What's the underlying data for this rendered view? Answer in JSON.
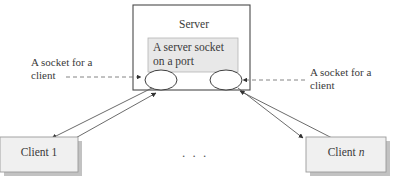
{
  "diagram": {
    "title_server": "Server",
    "server_socket_label": "A server socket\non a port",
    "left_note": "A socket for a\nclient",
    "right_note": "A socket for a\nclient",
    "client_first": "Client 1",
    "client_last_prefix": "Client ",
    "client_last_index": "n",
    "ellipsis": ". . .",
    "colors": {
      "background": "#ffffff",
      "stroke": "#4a4a4a",
      "box_fill": "#f0f0f0",
      "box_stroke": "#8f8f8f",
      "inner_box_fill": "#e6e6e6",
      "shadow": "#bdbdbd",
      "text": "#3a3a3a",
      "dashed_line": "#777777"
    },
    "shapes": {
      "server_box": {
        "x": 133,
        "y": 5,
        "w": 117,
        "h": 85
      },
      "server_socket_box": {
        "x": 148,
        "y": 38,
        "w": 90,
        "h": 34
      },
      "socket_ellipse_left": {
        "cx": 161,
        "cy": 80,
        "rx": 16,
        "ry": 10
      },
      "socket_ellipse_right": {
        "cx": 226,
        "cy": 80,
        "rx": 16,
        "ry": 10
      },
      "client_box_left": {
        "x": 0,
        "y": 137,
        "w": 78,
        "h": 35
      },
      "client_box_right": {
        "x": 306,
        "y": 137,
        "w": 80,
        "h": 35
      }
    }
  }
}
